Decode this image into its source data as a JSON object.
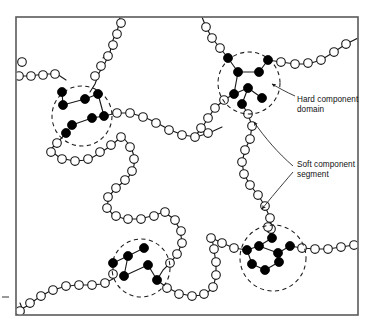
{
  "figure": {
    "frame": {
      "x": 16,
      "y": 17,
      "width": 342,
      "height": 298
    },
    "colors": {
      "frame_stroke": "#5a5a5a",
      "chain_stroke": "#1a1a1a",
      "soft_bead_fill": "#ffffff",
      "hard_bead_fill": "#000000",
      "domain_stroke": "#1a1a1a",
      "label_text": "#111111",
      "background": "#ffffff"
    },
    "bead_radius": {
      "soft": 4.3,
      "hard": 4.5
    }
  },
  "labels": [
    {
      "id": "hard-component-domain",
      "lines": [
        "Hard component",
        "domain"
      ],
      "line1": "Hard component",
      "line2": "domain",
      "x": 297,
      "y": 102
    },
    {
      "id": "soft-component-segment",
      "lines": [
        "Soft component",
        "segment"
      ],
      "line1": "Soft component",
      "line2": "segment",
      "x": 297,
      "y": 167
    }
  ],
  "domains": [
    {
      "id": "domain-upper-left",
      "cx": 82,
      "cy": 116,
      "r": 30
    },
    {
      "id": "domain-upper-right",
      "cx": 249,
      "cy": 83,
      "r": 31
    },
    {
      "id": "domain-lower-left",
      "cx": 141,
      "cy": 268,
      "r": 29
    },
    {
      "id": "domain-lower-right",
      "cx": 273,
      "cy": 258,
      "r": 33
    }
  ],
  "hard_beads": {
    "domain_upper_left": [
      [
        62,
        92
      ],
      [
        63,
        105
      ],
      [
        85,
        99
      ],
      [
        98,
        94
      ],
      [
        104,
        116
      ],
      [
        92,
        118
      ],
      [
        72,
        125
      ],
      [
        66,
        133
      ]
    ],
    "domain_upper_right": [
      [
        228,
        58
      ],
      [
        238,
        72
      ],
      [
        259,
        72
      ],
      [
        268,
        60
      ],
      [
        234,
        94
      ],
      [
        248,
        88
      ],
      [
        262,
        98
      ],
      [
        242,
        104
      ]
    ],
    "domain_lower_left": [
      [
        144,
        248
      ],
      [
        128,
        256
      ],
      [
        113,
        263
      ],
      [
        124,
        276
      ],
      [
        148,
        265
      ],
      [
        157,
        280
      ]
    ],
    "domain_lower_right": [
      [
        272,
        238
      ],
      [
        247,
        250
      ],
      [
        259,
        246
      ],
      [
        278,
        253
      ],
      [
        290,
        246
      ],
      [
        252,
        264
      ],
      [
        265,
        270
      ],
      [
        279,
        262
      ]
    ]
  },
  "annotations": {
    "hard_domain_arrow": "curved leader from label to upper-right domain boundary",
    "soft_segment_arrows": "two curved leaders from label to vertical soft chain"
  }
}
